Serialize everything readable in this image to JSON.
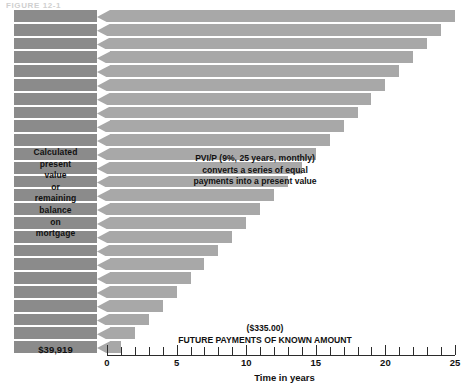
{
  "figure": {
    "caption": "FIGURE 12-1"
  },
  "left_panel": {
    "label_lines": [
      "Calculated",
      "present",
      "value",
      "or",
      "remaining",
      "balance",
      "on",
      "mortgage"
    ],
    "total_value": "$39,919"
  },
  "annotations": {
    "pvi_note_lines": [
      "PVI/P (9%, 25 years, monthly)",
      "converts a series of equal",
      "payments into a present value"
    ],
    "future_note_lines": [
      "($335.00)",
      "FUTURE PAYMENTS OF KNOWN AMOUNT"
    ]
  },
  "chart_data": {
    "type": "bar",
    "title": "FIGURE 12-1",
    "xlabel": "Time in years",
    "ylabel": "",
    "xlim": [
      0,
      25
    ],
    "grid": false,
    "legend": "none",
    "orientation": "horizontal",
    "bar_count": 25,
    "payment_amount": "($335.00)",
    "present_value": "$39,919",
    "rate": "9%",
    "term_years": 25,
    "compounding": "monthly",
    "categories": [
      1,
      2,
      3,
      4,
      5,
      6,
      7,
      8,
      9,
      10,
      11,
      12,
      13,
      14,
      15,
      16,
      17,
      18,
      19,
      20,
      21,
      22,
      23,
      24,
      25
    ],
    "values": [
      25,
      24,
      23,
      22,
      21,
      20,
      19,
      18,
      17,
      16,
      15,
      14,
      13,
      12,
      11,
      10,
      9,
      8,
      7,
      6,
      5,
      4,
      3,
      2,
      1
    ],
    "tick_labels": [
      "0",
      "5",
      "10",
      "15",
      "20",
      "25"
    ],
    "tick_values": [
      0,
      5,
      10,
      15,
      20,
      25
    ],
    "colors": {
      "present_value_bar": "#8b8b8b",
      "payment_bar": "#a8a8a8",
      "separator": "#ffffff",
      "axis": "#2b2b2b",
      "text": "#111111",
      "background": "#ffffff"
    }
  }
}
